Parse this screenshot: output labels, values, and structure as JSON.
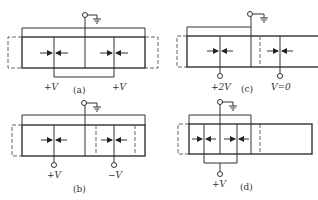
{
  "figure": {
    "panels": [
      {
        "id": "a",
        "caption": "(a)",
        "voltages": [
          "+V",
          "+V"
        ]
      },
      {
        "id": "b",
        "caption": "(b)",
        "voltages": [
          "+V",
          "−V"
        ]
      },
      {
        "id": "c",
        "caption": "(c)",
        "voltages": [
          "+2V",
          "V=0"
        ]
      },
      {
        "id": "d",
        "caption": "(d)",
        "voltages": [
          "+V"
        ]
      }
    ]
  },
  "colors": {
    "line": "#333333",
    "dash": "#555555",
    "background": "#ffffff"
  }
}
